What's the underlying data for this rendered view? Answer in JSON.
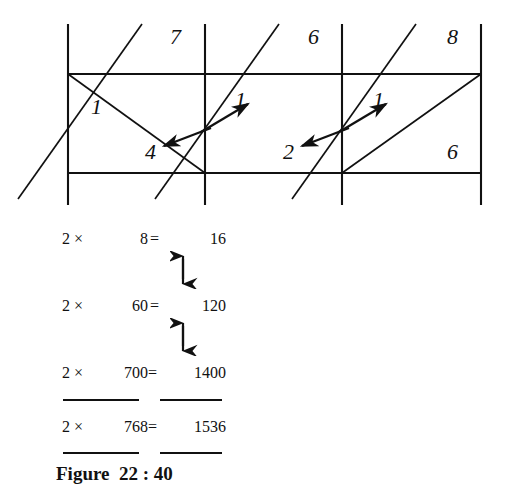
{
  "figure": {
    "caption": "Figure  22 : 40",
    "caption_number": "22 : 40",
    "type": "lattice-multiplication-diagram"
  },
  "lattice": {
    "multiplicand_digits": [
      "7",
      "6",
      "8"
    ],
    "top_labels": [
      {
        "text": "7",
        "x": 170,
        "y": 26
      },
      {
        "text": "6",
        "x": 308,
        "y": 26
      },
      {
        "text": "8",
        "x": 447,
        "y": 26
      }
    ],
    "inner_labels": [
      {
        "text": "1",
        "name": "carry-one-left",
        "x": 91,
        "y": 96
      },
      {
        "text": "4",
        "name": "product-four",
        "x": 145,
        "y": 142
      },
      {
        "text": "1",
        "name": "carry-one-middle",
        "x": 235,
        "y": 90
      },
      {
        "text": "2",
        "name": "product-two",
        "x": 283,
        "y": 142
      },
      {
        "text": "1",
        "name": "carry-one-right",
        "x": 373,
        "y": 90
      },
      {
        "text": "6",
        "name": "product-six",
        "x": 447,
        "y": 142
      }
    ],
    "grid": {
      "x_lines": [
        68,
        205,
        342,
        481
      ],
      "y_top": 74,
      "y_bottom": 173,
      "stroke": "#111111"
    }
  },
  "equations": {
    "rows": [
      {
        "factor": "2",
        "times": "×",
        "multiplier": "8",
        "equals": "=",
        "product": "16"
      },
      {
        "factor": "2",
        "times": "×",
        "multiplier": "60",
        "equals": "=",
        "product": "120"
      },
      {
        "factor": "2",
        "times": "×",
        "multiplier": "700",
        "equals": "=",
        "product": "1400"
      }
    ],
    "total": {
      "factor": "2",
      "times": "×",
      "multiplier": "768",
      "equals": "=",
      "product": "1536"
    }
  },
  "colors": {
    "ink": "#111111",
    "paper": "#ffffff"
  }
}
